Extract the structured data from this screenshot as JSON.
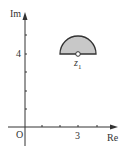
{
  "diagram": {
    "type": "complex-plane",
    "axes": {
      "y_label": "Im",
      "x_label": "Re",
      "origin_label": "O",
      "x_tick_label": "3",
      "y_tick_label": "4"
    },
    "region": {
      "shape": "upper half-disk",
      "center": [
        3,
        4
      ],
      "radius": 1,
      "fill": "#c8c8c8",
      "stroke": "#333333",
      "center_point_label": "z",
      "center_point_subscript": "1"
    }
  }
}
